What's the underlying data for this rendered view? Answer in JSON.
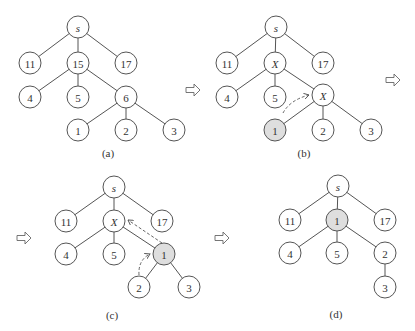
{
  "figure": {
    "panels": [
      {
        "id": "a",
        "caption": "(a)",
        "caption_pos": [
          108,
          157
        ],
        "nodes": [
          {
            "id": "s",
            "label": "s",
            "x": 78,
            "y": 27,
            "italic": true,
            "highlight": false
          },
          {
            "id": "n11",
            "label": "11",
            "x": 30,
            "y": 63,
            "highlight": false
          },
          {
            "id": "n15",
            "label": "15",
            "x": 78,
            "y": 63,
            "highlight": false
          },
          {
            "id": "n17",
            "label": "17",
            "x": 126,
            "y": 63,
            "highlight": false
          },
          {
            "id": "n4",
            "label": "4",
            "x": 30,
            "y": 97,
            "highlight": false
          },
          {
            "id": "n5",
            "label": "5",
            "x": 78,
            "y": 97,
            "highlight": false
          },
          {
            "id": "n6",
            "label": "6",
            "x": 126,
            "y": 97,
            "highlight": false
          },
          {
            "id": "n1",
            "label": "1",
            "x": 78,
            "y": 130,
            "highlight": false
          },
          {
            "id": "n2",
            "label": "2",
            "x": 126,
            "y": 130,
            "highlight": false
          },
          {
            "id": "n3",
            "label": "3",
            "x": 174,
            "y": 130,
            "highlight": false
          }
        ],
        "edges": [
          [
            "s",
            "n11"
          ],
          [
            "s",
            "n15"
          ],
          [
            "s",
            "n17"
          ],
          [
            "n15",
            "n4"
          ],
          [
            "n15",
            "n5"
          ],
          [
            "n15",
            "n6"
          ],
          [
            "n6",
            "n1"
          ],
          [
            "n6",
            "n2"
          ],
          [
            "n6",
            "n3"
          ]
        ],
        "dashed_arrows": []
      },
      {
        "id": "b",
        "caption": "(b)",
        "caption_pos": [
          304,
          157
        ],
        "nodes": [
          {
            "id": "s",
            "label": "s",
            "x": 276,
            "y": 27,
            "italic": true,
            "highlight": false
          },
          {
            "id": "n11",
            "label": "11",
            "x": 227,
            "y": 63,
            "highlight": false
          },
          {
            "id": "x1",
            "label": "X",
            "x": 275,
            "y": 63,
            "italic": true,
            "highlight": false
          },
          {
            "id": "n17",
            "label": "17",
            "x": 323,
            "y": 63,
            "highlight": false
          },
          {
            "id": "n4",
            "label": "4",
            "x": 227,
            "y": 97,
            "highlight": false
          },
          {
            "id": "n5",
            "label": "5",
            "x": 275,
            "y": 97,
            "highlight": false
          },
          {
            "id": "x2",
            "label": "X",
            "x": 323,
            "y": 95,
            "italic": true,
            "highlight": false
          },
          {
            "id": "n1",
            "label": "1",
            "x": 275,
            "y": 130,
            "highlight": true
          },
          {
            "id": "n2",
            "label": "2",
            "x": 323,
            "y": 130,
            "highlight": false
          },
          {
            "id": "n3",
            "label": "3",
            "x": 371,
            "y": 130,
            "highlight": false
          }
        ],
        "edges": [
          [
            "s",
            "n11"
          ],
          [
            "s",
            "x1"
          ],
          [
            "s",
            "n17"
          ],
          [
            "x1",
            "n4"
          ],
          [
            "x1",
            "n5"
          ],
          [
            "x1",
            "x2"
          ],
          [
            "x2",
            "n1"
          ],
          [
            "x2",
            "n2"
          ],
          [
            "x2",
            "n3"
          ]
        ],
        "dashed_arrows": [
          {
            "path": "M 283 113 Q 290 100 309 95",
            "head": [
              310,
              95
            ]
          }
        ]
      },
      {
        "id": "c",
        "caption": "(c)",
        "caption_pos": [
          112,
          319
        ],
        "nodes": [
          {
            "id": "s",
            "label": "s",
            "x": 114,
            "y": 187,
            "italic": true,
            "highlight": false
          },
          {
            "id": "n11",
            "label": "11",
            "x": 66,
            "y": 221,
            "highlight": false
          },
          {
            "id": "x1",
            "label": "X",
            "x": 114,
            "y": 221,
            "italic": true,
            "highlight": false
          },
          {
            "id": "n17",
            "label": "17",
            "x": 162,
            "y": 221,
            "highlight": false
          },
          {
            "id": "n4",
            "label": "4",
            "x": 66,
            "y": 254,
            "highlight": false
          },
          {
            "id": "n5",
            "label": "5",
            "x": 114,
            "y": 254,
            "highlight": false
          },
          {
            "id": "n1",
            "label": "1",
            "x": 164,
            "y": 254,
            "highlight": true
          },
          {
            "id": "n2",
            "label": "2",
            "x": 139,
            "y": 287,
            "highlight": false
          },
          {
            "id": "n3",
            "label": "3",
            "x": 189,
            "y": 287,
            "highlight": false
          }
        ],
        "edges": [
          [
            "s",
            "n11"
          ],
          [
            "s",
            "x1"
          ],
          [
            "s",
            "n17"
          ],
          [
            "x1",
            "n4"
          ],
          [
            "x1",
            "n5"
          ],
          [
            "x1",
            "n1"
          ],
          [
            "n1",
            "n2"
          ],
          [
            "n1",
            "n3"
          ]
        ],
        "dashed_arrows": [
          {
            "path": "M 162 243 L 128 220",
            "head": [
              128,
              220
            ]
          },
          {
            "path": "M 139 275 Q 138 260 150 254",
            "head": [
              150,
              254
            ]
          }
        ]
      },
      {
        "id": "d",
        "caption": "(d)",
        "caption_pos": [
          336,
          318
        ],
        "nodes": [
          {
            "id": "s",
            "label": "s",
            "x": 338,
            "y": 186,
            "italic": true,
            "highlight": false
          },
          {
            "id": "n11",
            "label": "11",
            "x": 290,
            "y": 220,
            "highlight": false
          },
          {
            "id": "n1",
            "label": "1",
            "x": 337,
            "y": 220,
            "highlight": true
          },
          {
            "id": "n17",
            "label": "17",
            "x": 385,
            "y": 220,
            "highlight": false
          },
          {
            "id": "n4",
            "label": "4",
            "x": 290,
            "y": 253,
            "highlight": false
          },
          {
            "id": "n5",
            "label": "5",
            "x": 337,
            "y": 253,
            "highlight": false
          },
          {
            "id": "n2",
            "label": "2",
            "x": 385,
            "y": 253,
            "highlight": false
          },
          {
            "id": "n3",
            "label": "3",
            "x": 385,
            "y": 287,
            "highlight": false
          }
        ],
        "edges": [
          [
            "s",
            "n11"
          ],
          [
            "s",
            "n1"
          ],
          [
            "s",
            "n17"
          ],
          [
            "n1",
            "n4"
          ],
          [
            "n1",
            "n5"
          ],
          [
            "n1",
            "n2"
          ],
          [
            "n2",
            "n3"
          ]
        ],
        "dashed_arrows": []
      }
    ],
    "flow_arrows": [
      {
        "x": 186,
        "y": 90
      },
      {
        "x": 386,
        "y": 80
      },
      {
        "x": 17,
        "y": 238
      },
      {
        "x": 215,
        "y": 238
      }
    ],
    "node_radius": 11,
    "highlight_color": "#dedede",
    "stroke_color": "#555555"
  }
}
